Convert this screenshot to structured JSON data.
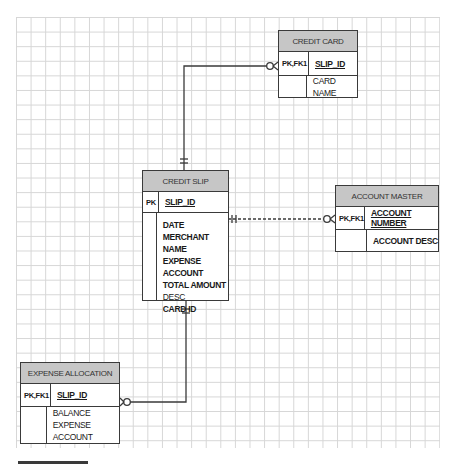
{
  "diagram": {
    "type": "entity-relationship",
    "entities": [
      {
        "id": "credit_card",
        "title": "CREDIT CARD",
        "key_rows": [
          {
            "key": "PK,FK1",
            "attributes": [
              {
                "name": "SLIP_ID",
                "primary": true
              }
            ]
          },
          {
            "key": "",
            "attributes": [
              {
                "name": "CARD NAME",
                "primary": false
              }
            ]
          }
        ]
      },
      {
        "id": "credit_slip",
        "title": "CREDIT SLIP",
        "key_rows": [
          {
            "key": "PK",
            "attributes": [
              {
                "name": "SLIP_ID",
                "primary": true
              }
            ]
          },
          {
            "key": "",
            "attributes": [
              {
                "name": "DATE"
              },
              {
                "name": "MERCHANT NAME"
              },
              {
                "name": "EXPENSE ACCOUNT"
              },
              {
                "name": "TOTAL AMOUNT"
              },
              {
                "name": "DESC"
              },
              {
                "name": "CARD ID"
              }
            ]
          }
        ]
      },
      {
        "id": "account_master",
        "title": "ACCOUNT MASTER",
        "key_rows": [
          {
            "key": "PK,FK1",
            "attributes": [
              {
                "name": "ACCOUNT NUMBER",
                "primary": true
              }
            ]
          },
          {
            "key": "",
            "attributes": [
              {
                "name": "ACCOUNT DESC",
                "primary": false
              }
            ]
          }
        ]
      },
      {
        "id": "expense_allocation",
        "title": "EXPENSE ALLOCATION",
        "key_rows": [
          {
            "key": "PK,FK1",
            "attributes": [
              {
                "name": "SLIP_ID",
                "primary": true
              }
            ]
          },
          {
            "key": "",
            "attributes": [
              {
                "name": "BALANCE"
              },
              {
                "name": "EXPENSE ACCOUNT"
              }
            ]
          }
        ]
      }
    ],
    "relationships": [
      {
        "from": "credit_slip",
        "to": "credit_card",
        "from_cardinality": "one-and-only-one",
        "to_cardinality": "zero-or-many",
        "line": "solid"
      },
      {
        "from": "credit_slip",
        "to": "account_master",
        "from_cardinality": "one-and-only-one",
        "to_cardinality": "zero-or-many",
        "line": "dashed"
      },
      {
        "from": "credit_slip",
        "to": "expense_allocation",
        "from_cardinality": "one-and-only-one",
        "to_cardinality": "zero-or-many",
        "line": "solid"
      }
    ]
  },
  "colors": {
    "header_fill": "#c6c6c6",
    "border": "#3a3a3a",
    "grid": "#d6d6d6"
  }
}
